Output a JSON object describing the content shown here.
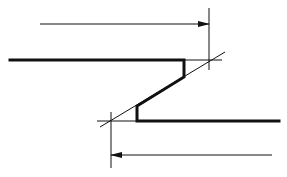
{
  "diagram": {
    "type": "technical-drawing",
    "colors": {
      "stroke": "#111111",
      "background": "#ffffff"
    },
    "elements": {
      "top_arrow": {
        "direction": "right",
        "y": 24,
        "x1": 40,
        "x2": 209
      },
      "bottom_arrow": {
        "direction": "left",
        "y": 155,
        "x1": 272,
        "x2": 111
      },
      "right_extension_line": {
        "x": 209,
        "y1": 8,
        "y2": 70
      },
      "left_extension_line": {
        "x": 111,
        "y1": 112,
        "y2": 168
      },
      "diagonal_reference_line": {
        "x1": 100,
        "y1": 127,
        "x2": 225,
        "y2": 52
      },
      "profile": {
        "upper_flange": {
          "y": 60,
          "x1": 10,
          "x2": 184
        },
        "upper_web": {
          "x": 184,
          "y1": 60,
          "y2": 77
        },
        "slope": {
          "x1": 184,
          "y1": 77,
          "x2": 137,
          "y2": 106
        },
        "lower_web": {
          "x": 137,
          "y1": 106,
          "y2": 121
        },
        "lower_flange": {
          "y": 121,
          "x1": 137,
          "x2": 279
        }
      }
    }
  }
}
